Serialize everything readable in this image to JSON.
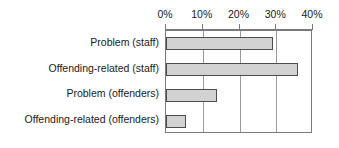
{
  "chart_data": {
    "type": "bar",
    "orientation": "horizontal",
    "title": "",
    "xlabel": "",
    "ylabel": "",
    "categories": [
      "Problem (staff)",
      "Offending-related (staff)",
      "Problem (offenders)",
      "Offending-related (offenders)"
    ],
    "values": [
      29,
      36,
      14,
      5.5
    ],
    "value_unit": "%",
    "xlim": [
      0,
      40
    ],
    "xticks": [
      0,
      10,
      20,
      30,
      40
    ],
    "xtick_labels": [
      "0%",
      "10%",
      "20%",
      "30%",
      "40%"
    ],
    "grid": true,
    "grid_axis": "x",
    "legend": false,
    "legend_position": "none",
    "bar_fill_color": "#d2d2d2",
    "bar_border_color": "#4d4d4d",
    "gridline_color": "#9a9a9a",
    "axis_color": "#7a7a7a",
    "text_color": "#1a1a1a",
    "background_color": "#ffffff",
    "series": [
      {
        "name": "Percentage",
        "values": [
          29,
          36,
          14,
          5.5
        ]
      }
    ]
  }
}
